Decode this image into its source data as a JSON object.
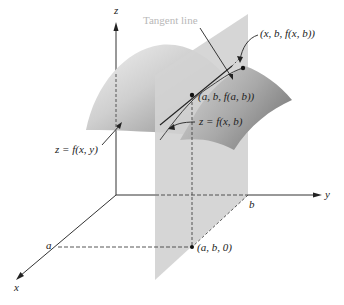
{
  "diagram": {
    "type": "3d-surface-partial-derivative",
    "axes": {
      "x_label": "x",
      "y_label": "y",
      "z_label": "z",
      "x_tick": "a",
      "y_tick": "b"
    },
    "labels": {
      "tangent_line": "Tangent line",
      "point_xb": "(x, b, f(x, b))",
      "point_ab": "(a, b, f(a, b))",
      "trace_curve": "z = f(x, b)",
      "surface": "z = f(x, y)",
      "base_point": "(a, b, 0)"
    },
    "colors": {
      "surface_light": "#e6e6e6",
      "surface_dark": "#8f8f8f",
      "plane": "#d2d2d2",
      "axis": "#333333",
      "tangent_label": "#b8b8b8"
    }
  }
}
